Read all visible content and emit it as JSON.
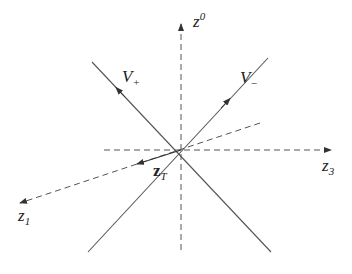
{
  "diagram": {
    "type": "light-cone axes diagram",
    "axes": [
      {
        "id": "z0",
        "label": "z",
        "sup": "0",
        "style": "dashed",
        "direction": "up"
      },
      {
        "id": "z3",
        "label": "z",
        "sub": "3",
        "style": "dashed",
        "direction": "right"
      },
      {
        "id": "z1",
        "label": "z",
        "sub": "1",
        "style": "dashed",
        "direction": "down-left"
      }
    ],
    "lines": [
      {
        "id": "V_plus",
        "label": "V",
        "sub": "+",
        "style": "solid"
      },
      {
        "id": "V_minus",
        "label": "V",
        "sub": "−",
        "style": "solid"
      }
    ],
    "vector": {
      "id": "zT",
      "label": "z",
      "sub": "T",
      "style": "solid",
      "bold": true
    },
    "colors": {
      "line": "#555555",
      "text": "#222222",
      "background": "#ffffff"
    }
  }
}
